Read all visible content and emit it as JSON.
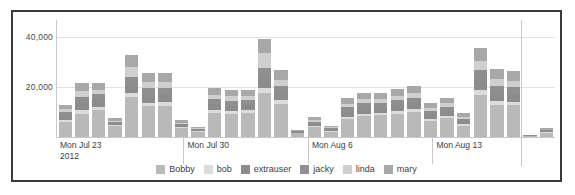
{
  "panel": {
    "border_color": "#3b3b3b",
    "background": "#ffffff"
  },
  "chart_data": {
    "type": "bar",
    "stacked": true,
    "title": "",
    "xlabel": "",
    "ylabel": "",
    "ylim": [
      0,
      47000
    ],
    "grid": true,
    "gridlines": [
      20000,
      40000
    ],
    "ytick_labels": [
      "20,000",
      "40,000"
    ],
    "legend_position": "bottom",
    "series": [
      {
        "name": "Bobby",
        "color": "#b9b9b9",
        "values": [
          6200,
          9400,
          10800,
          4300,
          16200,
          12300,
          12600,
          3600,
          2100,
          9600,
          9200,
          9700,
          17800,
          13200,
          1500,
          3900,
          2200,
          7200,
          8400,
          8700,
          9300,
          9900,
          6500,
          7600,
          4600,
          16800,
          12900,
          12700,
          400,
          1700
        ]
      },
      {
        "name": "bob",
        "color": "#dcdcdc",
        "values": [
          700,
          1400,
          1300,
          500,
          1500,
          1500,
          1500,
          400,
          300,
          1200,
          1100,
          1100,
          1900,
          1500,
          200,
          600,
          300,
          900,
          1000,
          1000,
          1100,
          1200,
          800,
          900,
          600,
          1900,
          1500,
          1500,
          80,
          250
        ]
      },
      {
        "name": "extrauser",
        "color": "#8c8c8c",
        "values": [
          1600,
          2800,
          2600,
          700,
          3300,
          3100,
          3000,
          700,
          400,
          2400,
          2300,
          2200,
          4100,
          3100,
          300,
          900,
          500,
          2000,
          2200,
          2100,
          2300,
          2500,
          1700,
          1900,
          1100,
          4200,
          3300,
          3100,
          100,
          400
        ]
      },
      {
        "name": "jacky",
        "color": "#8f8f8f",
        "values": [
          1500,
          2600,
          2400,
          600,
          3000,
          2700,
          2700,
          600,
          350,
          2100,
          2000,
          2000,
          3800,
          2900,
          250,
          800,
          450,
          1800,
          2000,
          1900,
          2100,
          2200,
          1500,
          1700,
          1000,
          3900,
          3000,
          2900,
          90,
          350
        ]
      },
      {
        "name": "linda",
        "color": "#cfcfcf",
        "values": [
          1100,
          2200,
          1900,
          500,
          4100,
          2500,
          2400,
          500,
          300,
          1700,
          1700,
          1600,
          6200,
          2400,
          200,
          700,
          400,
          1500,
          1700,
          1600,
          1800,
          1900,
          1300,
          1500,
          900,
          3600,
          2600,
          2500,
          70,
          300
        ]
      },
      {
        "name": "mary",
        "color": "#a8a8a8",
        "values": [
          1900,
          3300,
          2800,
          900,
          4800,
          3800,
          3700,
          900,
          500,
          2600,
          2500,
          2500,
          5600,
          3700,
          350,
          1100,
          600,
          2200,
          2400,
          2400,
          2700,
          2800,
          2000,
          2200,
          1400,
          5200,
          3900,
          3900,
          110,
          450
        ]
      }
    ],
    "bar_count": 30,
    "group_ticks": [
      {
        "label": "Mon Jul 23",
        "year": "2012",
        "x_pct": 0.0
      },
      {
        "label": "Mon Jul 30",
        "year": "",
        "x_pct": 25.6
      },
      {
        "label": "Mon Aug 6",
        "year": "",
        "x_pct": 50.6
      },
      {
        "label": "Mon Aug 13",
        "year": "",
        "x_pct": 75.6
      }
    ],
    "tail_separator_x_pct": 93.4
  },
  "legend": {
    "items": [
      {
        "label": "Bobby",
        "color": "#b9b9b9"
      },
      {
        "label": "bob",
        "color": "#dcdcdc"
      },
      {
        "label": "extrauser",
        "color": "#8c8c8c"
      },
      {
        "label": "jacky",
        "color": "#8f8f8f"
      },
      {
        "label": "linda",
        "color": "#cfcfcf"
      },
      {
        "label": "mary",
        "color": "#a8a8a8"
      }
    ]
  }
}
